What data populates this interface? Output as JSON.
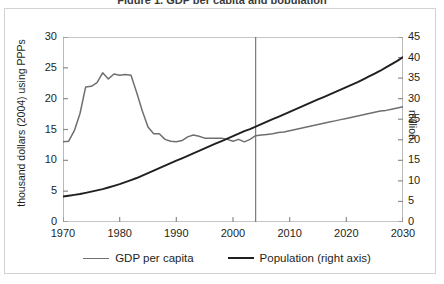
{
  "figure": {
    "clipped_title": "Figure 1. GDP per capita and population",
    "background": "#ffffff",
    "border_color": "#d2d2d2"
  },
  "axes": {
    "left_title": "thousand dollars (2004) using PPPs",
    "right_title": "million",
    "x_title": ""
  },
  "legend": {
    "items": [
      {
        "label": "GDP per capita",
        "color": "#6f6f6f"
      },
      {
        "label": "Population (right axis)",
        "color": "#231f20"
      }
    ]
  },
  "marker": {
    "divider_year": 2004,
    "divider_color": "#6f6f6f"
  },
  "chart_data": {
    "type": "line",
    "title": "GDP per capita and population",
    "xlabel": "",
    "ylabel": "thousand dollars (2004) using PPPs",
    "y2label": "million",
    "xlim": [
      1970,
      2030
    ],
    "ylim": [
      0,
      30
    ],
    "y2lim": [
      0,
      45
    ],
    "xticks": [
      1970,
      1980,
      1990,
      2000,
      2010,
      2020,
      2030
    ],
    "yticks": [
      0,
      5,
      10,
      15,
      20,
      25,
      30
    ],
    "y2ticks": [
      0,
      5,
      10,
      15,
      20,
      25,
      30,
      35,
      40,
      45
    ],
    "grid": false,
    "legend_position": "bottom",
    "annotations": [
      {
        "type": "vline",
        "x": 2004,
        "label": "projection start"
      }
    ],
    "x": [
      1970,
      1971,
      1972,
      1973,
      1974,
      1975,
      1976,
      1977,
      1978,
      1979,
      1980,
      1981,
      1982,
      1983,
      1984,
      1985,
      1986,
      1987,
      1988,
      1989,
      1990,
      1991,
      1992,
      1993,
      1994,
      1995,
      1996,
      1997,
      1998,
      1999,
      2000,
      2001,
      2002,
      2003,
      2004,
      2005,
      2006,
      2007,
      2008,
      2009,
      2010,
      2011,
      2012,
      2013,
      2014,
      2015,
      2016,
      2017,
      2018,
      2019,
      2020,
      2021,
      2022,
      2023,
      2024,
      2025,
      2026,
      2027,
      2028,
      2029,
      2030
    ],
    "series": [
      {
        "name": "GDP per capita",
        "axis": "left",
        "color": "#6f6f6f",
        "unit": "thousand dollars (2004) using PPPs",
        "values": [
          13.0,
          13.1,
          14.8,
          17.6,
          21.9,
          22.0,
          22.6,
          24.2,
          23.2,
          24.0,
          23.8,
          23.9,
          23.8,
          21.0,
          18.0,
          15.4,
          14.3,
          14.3,
          13.4,
          13.1,
          13.0,
          13.2,
          13.8,
          14.1,
          13.9,
          13.6,
          13.6,
          13.6,
          13.6,
          13.4,
          13.1,
          13.4,
          13.0,
          13.4,
          14.0,
          14.1,
          14.2,
          14.3,
          14.5,
          14.6,
          14.8,
          15.0,
          15.2,
          15.4,
          15.6,
          15.8,
          16.0,
          16.2,
          16.4,
          16.6,
          16.8,
          17.0,
          17.2,
          17.4,
          17.6,
          17.8,
          18.0,
          18.1,
          18.3,
          18.5,
          18.7
        ]
      },
      {
        "name": "Population (right axis)",
        "axis": "right",
        "color": "#231f20",
        "unit": "million",
        "values": [
          6.2,
          6.4,
          6.6,
          6.8,
          7.1,
          7.4,
          7.7,
          8.0,
          8.4,
          8.8,
          9.2,
          9.7,
          10.2,
          10.7,
          11.3,
          11.9,
          12.5,
          13.1,
          13.7,
          14.3,
          14.9,
          15.5,
          16.1,
          16.7,
          17.3,
          17.9,
          18.5,
          19.1,
          19.7,
          20.3,
          20.9,
          21.5,
          22.1,
          22.6,
          23.2,
          23.8,
          24.4,
          25.0,
          25.6,
          26.2,
          26.8,
          27.4,
          28.0,
          28.6,
          29.2,
          29.8,
          30.4,
          31.0,
          31.6,
          32.2,
          32.8,
          33.4,
          34.0,
          34.7,
          35.4,
          36.1,
          36.8,
          37.6,
          38.4,
          39.2,
          40.1
        ]
      }
    ]
  }
}
